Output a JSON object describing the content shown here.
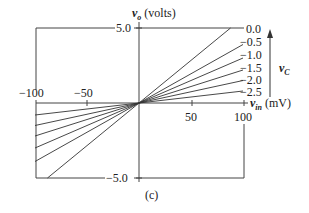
{
  "chart_data": {
    "type": "line",
    "title": "",
    "caption": "(c)",
    "xlabel": "v_in (mV)",
    "ylabel": "v_o (volts)",
    "xlim": [
      -100,
      100
    ],
    "ylim": [
      -5.0,
      5.0
    ],
    "x_ticks": [
      "-100",
      "-50",
      "50",
      "100"
    ],
    "y_ticks": [
      "5.0",
      "-5.0"
    ],
    "legend_title": "v_C",
    "legend_arrow": "up",
    "series": [
      {
        "name": "0.0",
        "x": [
          -88,
          88
        ],
        "y": [
          -5.0,
          5.0
        ]
      },
      {
        "name": "-0.5",
        "x": [
          -100,
          100
        ],
        "y": [
          -3.9,
          3.9
        ]
      },
      {
        "name": "-1.0",
        "x": [
          -100,
          100
        ],
        "y": [
          -3.0,
          3.0
        ]
      },
      {
        "name": "-1.5",
        "x": [
          -100,
          100
        ],
        "y": [
          -2.2,
          2.2
        ]
      },
      {
        "name": "-2.0",
        "x": [
          -100,
          100
        ],
        "y": [
          -1.5,
          1.5
        ]
      },
      {
        "name": "-2.5",
        "x": [
          -100,
          100
        ],
        "y": [
          -0.8,
          0.8
        ]
      }
    ]
  },
  "labels": {
    "y_axis_var": "v",
    "y_axis_sub": "o",
    "y_axis_unit": " (volts)",
    "x_axis_var": "v",
    "x_axis_sub": "in",
    "x_axis_unit": " (mV)",
    "legend_var": "v",
    "legend_sub": "C",
    "y_top": "5.0",
    "y_bottom": "−5.0",
    "x_m100": "−100",
    "x_m50": "−50",
    "x_50": "50",
    "x_100": "100",
    "caption": "(c)",
    "series_labels": [
      "0.0",
      "−0.5",
      "−1.0",
      "−1.5",
      "−2.0",
      "−2.5"
    ]
  },
  "colors": {
    "line": "#333333",
    "frame": "#444444"
  }
}
